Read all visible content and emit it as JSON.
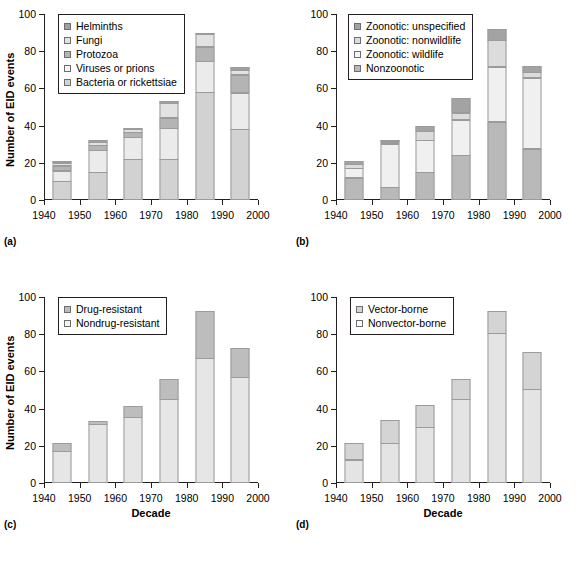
{
  "figure": {
    "y_axis_title": "Number of EID events",
    "x_axis_title": "Decade",
    "y_ticks": [
      "0",
      "20",
      "40",
      "60",
      "80",
      "100"
    ],
    "x_ticks": [
      "1940",
      "1950",
      "1960",
      "1970",
      "1980",
      "1990",
      "2000"
    ],
    "panel_labels": {
      "a": "(a)",
      "b": "(b)",
      "c": "(c)",
      "d": "(d)"
    },
    "colors": {
      "bar_outline": "#9b9b9b",
      "axis": "#231f20",
      "background": "#ffffff",
      "gray_light": "#ededed",
      "gray_mid_light": "#dcdcdc",
      "gray_mid": "#c9c9c9",
      "gray_dark": "#a8a8a8",
      "gray_darkest": "#8c8c8c"
    }
  },
  "chart_data": [
    {
      "type": "bar",
      "panel": "(a)",
      "title": "",
      "xlabel": "Decade",
      "ylabel": "Number of EID events",
      "ylim": [
        0,
        100
      ],
      "xlim": [
        1940,
        2000
      ],
      "grid": false,
      "stacked": true,
      "legend_position": "top-left",
      "categories": [
        "1940s",
        "1950s",
        "1960s",
        "1970s",
        "1980s",
        "1990s"
      ],
      "series": [
        {
          "name": "Bacteria or rickettsiae",
          "color": "#d2d2d2",
          "values": [
            10,
            15,
            22,
            22,
            58,
            38
          ]
        },
        {
          "name": "Viruses or prions",
          "color": "#ebebeb",
          "values": [
            6,
            12,
            12,
            17,
            17,
            20
          ]
        },
        {
          "name": "Protozoa",
          "color": "#b4b4b4",
          "values": [
            3,
            3,
            3,
            6,
            8,
            10
          ]
        },
        {
          "name": "Fungi",
          "color": "#e2e2e2",
          "values": [
            2,
            2,
            2,
            8,
            7,
            3
          ]
        },
        {
          "name": "Helminths",
          "color": "#a0a0a0",
          "values": [
            1,
            1.5,
            1,
            1.5,
            1,
            2
          ]
        }
      ],
      "totals": [
        22,
        33.5,
        40,
        54.5,
        91,
        73
      ]
    },
    {
      "type": "bar",
      "panel": "(b)",
      "title": "",
      "xlabel": "Decade",
      "ylabel": "Number of EID events",
      "ylim": [
        0,
        100
      ],
      "xlim": [
        1940,
        2000
      ],
      "grid": false,
      "stacked": true,
      "legend_position": "top-left",
      "categories": [
        "1940s",
        "1950s",
        "1960s",
        "1970s",
        "1980s",
        "1990s"
      ],
      "series": [
        {
          "name": "Nonzoonotic",
          "color": "#b9b9b9",
          "values": [
            12,
            7,
            15,
            24,
            42,
            27.5
          ]
        },
        {
          "name": "Zoonotic: wildlife",
          "color": "#f0f0f0",
          "values": [
            5.5,
            23.5,
            17.5,
            19.5,
            30,
            38.5
          ]
        },
        {
          "name": "Zoonotic: nonwildlife",
          "color": "#dcdcdc",
          "values": [
            2.5,
            1.5,
            5,
            4,
            14.5,
            3.5
          ]
        },
        {
          "name": "Zoonotic: unspecified",
          "color": "#a3a3a3",
          "values": [
            2,
            1,
            3.5,
            8.5,
            6.5,
            3.5
          ]
        }
      ],
      "totals": [
        22,
        33,
        41,
        56,
        93,
        73
      ]
    },
    {
      "type": "bar",
      "panel": "(c)",
      "title": "",
      "xlabel": "Decade",
      "ylabel": "Number of EID events",
      "ylim": [
        0,
        100
      ],
      "xlim": [
        1940,
        2000
      ],
      "grid": false,
      "stacked": true,
      "legend_position": "top-left",
      "categories": [
        "1940s",
        "1950s",
        "1960s",
        "1970s",
        "1980s",
        "1990s"
      ],
      "series": [
        {
          "name": "Nondrug-resistant",
          "color": "#e6e6e6",
          "values": [
            17,
            31.5,
            35.5,
            45,
            67,
            57
          ]
        },
        {
          "name": "Drug-resistant",
          "color": "#bdbdbd",
          "values": [
            5,
            2,
            6,
            11.5,
            26,
            16
          ]
        }
      ],
      "totals": [
        22,
        33.5,
        41.5,
        56.5,
        93,
        73
      ]
    },
    {
      "type": "bar",
      "panel": "(d)",
      "title": "",
      "xlabel": "Decade",
      "ylabel": "Number of EID events",
      "ylim": [
        0,
        100
      ],
      "xlim": [
        1940,
        2000
      ],
      "grid": false,
      "stacked": true,
      "legend_position": "top-left",
      "categories": [
        "1940s",
        "1950s",
        "1960s",
        "1970s",
        "1980s",
        "1990s"
      ],
      "series": [
        {
          "name": "Nonvector-borne",
          "color": "#e4e4e4",
          "values": [
            12.5,
            21.5,
            30,
            45,
            80.5,
            50.5
          ]
        },
        {
          "name": "Vector-borne",
          "color": "#d4d4d4",
          "values": [
            9.5,
            12.5,
            12,
            11.5,
            12.5,
            20.5
          ]
        }
      ],
      "totals": [
        22,
        34,
        42,
        56.5,
        93,
        71
      ]
    }
  ],
  "legends": {
    "a": {
      "items": [
        {
          "label": "Helminths",
          "color": "#a0a0a0"
        },
        {
          "label": "Fungi",
          "color": "#e2e2e2"
        },
        {
          "label": "Protozoa",
          "color": "#b4b4b4"
        },
        {
          "label": "Viruses or prions",
          "color": "#f5f5f5"
        },
        {
          "label": "Bacteria or rickettsiae",
          "color": "#d2d2d2"
        }
      ]
    },
    "b": {
      "items": [
        {
          "label": "Zoonotic: unspecified",
          "color": "#a3a3a3"
        },
        {
          "label": "Zoonotic: nonwildlife",
          "color": "#dcdcdc"
        },
        {
          "label": "Zoonotic: wildlife",
          "color": "#f5f5f5"
        },
        {
          "label": "Nonzoonotic",
          "color": "#b9b9b9"
        }
      ]
    },
    "c": {
      "items": [
        {
          "label": "Drug-resistant",
          "color": "#bdbdbd"
        },
        {
          "label": "Nondrug-resistant",
          "color": "#f2f2f2"
        }
      ]
    },
    "d": {
      "items": [
        {
          "label": "Vector-borne",
          "color": "#d4d4d4"
        },
        {
          "label": "Nonvector-borne",
          "color": "#fbfbfb"
        }
      ]
    }
  }
}
